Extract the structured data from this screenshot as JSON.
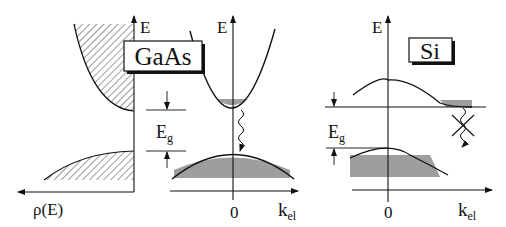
{
  "figure": {
    "panels": [
      {
        "id": "dos",
        "axis_x_label": "ρ(E)",
        "axis_y_label": "E"
      },
      {
        "id": "gaas",
        "material": "GaAs",
        "gap_type": "direct",
        "axis_y_label": "E",
        "axis_x_label_main": "k",
        "axis_x_label_sub": "el",
        "origin_label": "0",
        "gap_label_main": "E",
        "gap_label_sub": "g"
      },
      {
        "id": "si",
        "material": "Si",
        "gap_type": "indirect",
        "axis_y_label": "E",
        "axis_x_label_main": "k",
        "axis_x_label_sub": "el",
        "origin_label": "0",
        "gap_label_main": "E",
        "gap_label_sub": "g"
      }
    ],
    "colors": {
      "line": "#111111",
      "fill_gray": "#9e9e9e",
      "background": "#ffffff"
    }
  }
}
